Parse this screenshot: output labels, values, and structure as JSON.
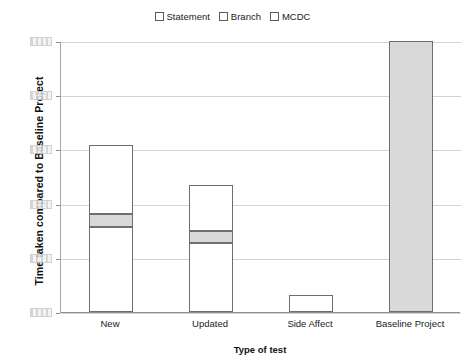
{
  "chart_data": {
    "type": "bar",
    "stacked": true,
    "title": "",
    "xlabel": "Type of test",
    "ylabel": "Time taken compared to Baseline Project",
    "categories": [
      "New",
      "Updated",
      "Side Affect",
      "Baseline Project"
    ],
    "series": [
      {
        "name": "Statement",
        "values": [
          31.4,
          25.6,
          6.3,
          0.0
        ],
        "color": "#ffffff"
      },
      {
        "name": "Branch",
        "values": [
          4.8,
          4.4,
          0.0,
          0.0
        ],
        "color": "#d9d9d9"
      },
      {
        "name": "MCDC",
        "values": [
          25.5,
          16.7,
          0.0,
          0.0
        ],
        "color": "#ffffff"
      }
    ],
    "baseline_series": {
      "name": "Baseline Project",
      "value": 100.0,
      "color": "#d9d9d9"
    },
    "totals": [
      61.7,
      46.7,
      6.3,
      100.0
    ],
    "ylim": [
      0,
      100
    ],
    "yticks": [
      0,
      20,
      40,
      60,
      80,
      100
    ],
    "ytick_labels": [
      "",
      "",
      "",
      "",
      "",
      ""
    ],
    "ytick_labels_note": "obscured",
    "grid": true,
    "legend_position": "top-center"
  },
  "legend": {
    "entries": [
      {
        "label": "Statement",
        "swatch": "open-square",
        "color": "#ffffff"
      },
      {
        "label": "Branch",
        "swatch": "open-square",
        "color": "#ffffff"
      },
      {
        "label": "MCDC",
        "swatch": "open-square",
        "color": "#ffffff"
      }
    ]
  },
  "axes": {
    "y_title": "Time taken compared to Baseline Project",
    "x_title": "Type of test",
    "x_categories": [
      {
        "label": "New"
      },
      {
        "label": "Updated"
      },
      {
        "label": "Side Affect"
      },
      {
        "label": "Baseline Project"
      }
    ]
  }
}
